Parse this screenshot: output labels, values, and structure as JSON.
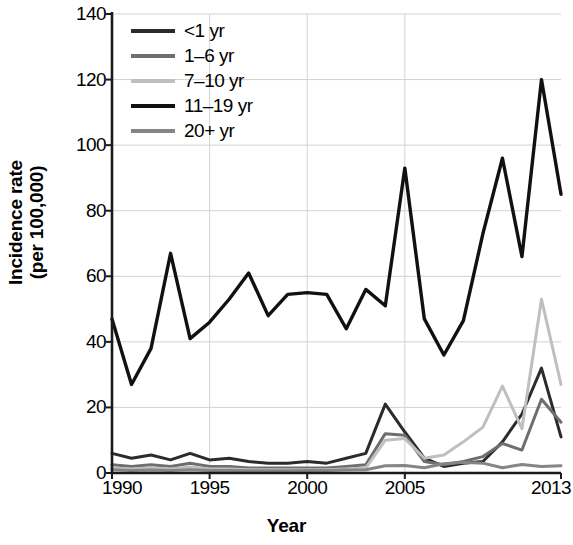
{
  "chart_data": {
    "type": "line",
    "title": "",
    "xlabel": "Year",
    "ylabel": "Incidence rate (per 100,000)",
    "ylabel_line1": "Incidence rate",
    "ylabel_line2": "(per 100,000)",
    "xlim": [
      1990,
      2013
    ],
    "ylim": [
      0,
      140
    ],
    "grid": true,
    "legend_position": "top-left",
    "ytick_values": [
      0,
      20,
      40,
      60,
      80,
      100,
      120,
      140
    ],
    "ytick_labels": [
      "0",
      "20",
      "40",
      "60",
      "80",
      "100",
      "120",
      "140"
    ],
    "xtick_values": [
      1990,
      1995,
      2000,
      2005,
      2013
    ],
    "xtick_labels": [
      "1990",
      "1995",
      "2000",
      "2005",
      "2013"
    ],
    "x": [
      1990,
      1991,
      1992,
      1993,
      1994,
      1995,
      1996,
      1997,
      1998,
      1999,
      2000,
      2001,
      2002,
      2003,
      2004,
      2005,
      2006,
      2007,
      2008,
      2009,
      2010,
      2011,
      2012,
      2013
    ],
    "series": [
      {
        "name": "<1 yr",
        "color": "#2b2b2b",
        "width": 3.0,
        "values": [
          6.0,
          4.5,
          5.5,
          4.0,
          6.0,
          4.0,
          4.5,
          3.5,
          3.0,
          3.0,
          3.5,
          3.0,
          4.5,
          6.0,
          21.0,
          12.5,
          4.5,
          2.0,
          3.0,
          3.5,
          9.5,
          18.0,
          32.0,
          11.0
        ]
      },
      {
        "name": "1–6 yr",
        "color": "#6e6e6e",
        "width": 3.0,
        "values": [
          2.5,
          2.0,
          2.5,
          2.0,
          3.0,
          2.0,
          2.0,
          1.5,
          1.5,
          1.5,
          1.5,
          1.5,
          2.0,
          2.5,
          12.0,
          11.5,
          3.5,
          2.5,
          3.5,
          5.0,
          9.0,
          7.0,
          22.5,
          15.5
        ]
      },
      {
        "name": "7–10 yr",
        "color": "#bfbfbf",
        "width": 3.0,
        "values": [
          1.5,
          1.2,
          1.5,
          1.2,
          1.8,
          1.2,
          1.2,
          1.0,
          1.0,
          1.0,
          1.0,
          1.0,
          1.2,
          1.5,
          10.0,
          10.5,
          4.5,
          5.5,
          9.5,
          14.0,
          26.5,
          13.5,
          53.0,
          27.0
        ]
      },
      {
        "name": "11–19 yr",
        "color": "#111111",
        "width": 3.4,
        "values": [
          47.0,
          27.0,
          38.0,
          67.0,
          41.0,
          46.0,
          53.0,
          61.0,
          48.0,
          54.5,
          55.0,
          54.5,
          44.0,
          56.0,
          51.0,
          93.0,
          47.0,
          36.0,
          46.5,
          73.0,
          96.0,
          66.0,
          120.0,
          85.0
        ]
      },
      {
        "name": "20+ yr",
        "color": "#858585",
        "width": 3.0,
        "values": [
          1.0,
          0.8,
          0.9,
          0.8,
          1.0,
          0.8,
          0.8,
          0.7,
          0.7,
          0.7,
          0.8,
          0.8,
          0.9,
          1.0,
          2.2,
          2.3,
          1.6,
          2.8,
          3.3,
          3.0,
          1.6,
          2.6,
          2.0,
          2.2
        ]
      }
    ]
  },
  "legend": {
    "items": [
      {
        "label": "<1 yr",
        "color": "#2b2b2b"
      },
      {
        "label": "1–6 yr",
        "color": "#6e6e6e"
      },
      {
        "label": "7–10 yr",
        "color": "#bfbfbf"
      },
      {
        "label": "11–19 yr",
        "color": "#111111"
      },
      {
        "label": "20+ yr",
        "color": "#858585"
      }
    ]
  },
  "style": {
    "axis_color": "#1a1a1a",
    "grid_color": "#d2d2d2",
    "background": "#ffffff"
  }
}
